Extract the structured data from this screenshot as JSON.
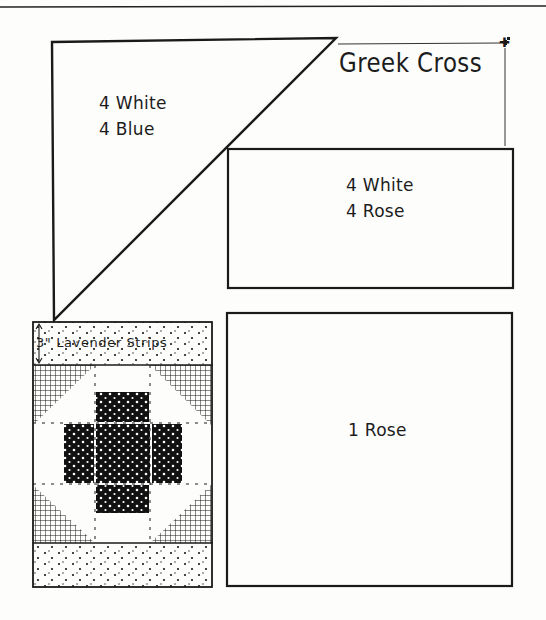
{
  "page": {
    "background": "#fdfdfb",
    "ink_color": "#1a1a1a"
  },
  "title": {
    "text": "Greek Cross"
  },
  "pattern_pieces": [
    {
      "id": "triangle",
      "shape": "triangle",
      "lines": [
        "4 White",
        "4 Blue"
      ]
    },
    {
      "id": "rectangle",
      "shape": "rectangle",
      "lines": [
        "4 White",
        "4 Rose"
      ]
    },
    {
      "id": "square",
      "shape": "square",
      "lines": [
        "1 Rose"
      ]
    }
  ],
  "block_preview": {
    "strip_label": "3\" Lavender Strips",
    "fabrics": {
      "cross": "dark dotted",
      "corners": "cross-hatched",
      "strips": "lavender stippled",
      "background": "white"
    }
  }
}
